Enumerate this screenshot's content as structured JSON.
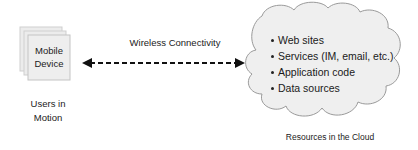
{
  "diagram": {
    "device": {
      "label_line1": "Mobile",
      "label_line2": "Device",
      "caption_line1": "Users in",
      "caption_line2": "Motion"
    },
    "connection": {
      "label": "Wireless Connectivity",
      "style": "dashed-bidirectional-arrow"
    },
    "cloud": {
      "items": [
        {
          "label": "Web sites"
        },
        {
          "label": "Services (IM, email, etc.)"
        },
        {
          "label": "Application code"
        },
        {
          "label": "Data sources"
        }
      ],
      "caption": "Resources in the Cloud"
    },
    "colors": {
      "card_fill": "#ececec",
      "card_stroke": "#c8c8c8",
      "cloud_fill": "#efefef",
      "cloud_stroke": "#9a9a9a",
      "arrow": "#111111"
    }
  }
}
